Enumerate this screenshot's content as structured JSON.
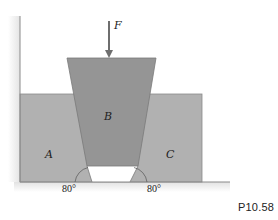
{
  "figure": {
    "caption": "P10.58",
    "force_label": "F",
    "blocks": {
      "left": "A",
      "wedge": "B",
      "right": "C"
    },
    "angles": {
      "left": "80°",
      "right": "80°"
    },
    "colors": {
      "blocks_ac": "#b1b1b1",
      "wedge_b": "#959595",
      "outline": "#7a7a7a",
      "arrow": "#6e6e6e",
      "wall_shadow": "#ececec",
      "background": "#ffffff"
    }
  }
}
